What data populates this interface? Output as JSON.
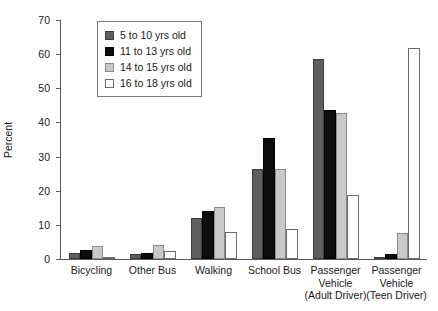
{
  "chart_data": {
    "type": "bar",
    "title": "",
    "xlabel": "",
    "ylabel": "Percent",
    "ylim": [
      0,
      70
    ],
    "yticks": [
      0,
      10,
      20,
      30,
      40,
      50,
      60,
      70
    ],
    "grid": false,
    "legend_position": "top-left-inset",
    "categories": [
      "Bicycling",
      "Other Bus",
      "Walking",
      "School Bus",
      "Passenger Vehicle (Adult Driver)",
      "Passenger Vehicle (Teen Driver)"
    ],
    "category_lines": [
      [
        "Bicycling"
      ],
      [
        "Other Bus"
      ],
      [
        "Walking"
      ],
      [
        "School Bus"
      ],
      [
        "Passenger",
        "Vehicle",
        "(Adult Driver)"
      ],
      [
        "Passenger",
        "Vehicle",
        "(Teen Driver)"
      ]
    ],
    "series": [
      {
        "name": "5 to 10 yrs old",
        "color": "#5e5e5e",
        "values": [
          1.8,
          1.4,
          12.0,
          26.3,
          58.7,
          0.2
        ]
      },
      {
        "name": "11 to 13 yrs old",
        "color": "#0d0d0d",
        "values": [
          2.7,
          1.8,
          14.0,
          35.3,
          43.7,
          1.5
        ]
      },
      {
        "name": "14 to 15 yrs old",
        "color": "#c9c9c9",
        "values": [
          3.8,
          4.2,
          15.2,
          26.5,
          42.8,
          7.6
        ]
      },
      {
        "name": "16 to 18 yrs old",
        "color": "#ffffff",
        "values": [
          0.4,
          2.3,
          8.0,
          8.8,
          18.7,
          61.7
        ]
      }
    ]
  }
}
